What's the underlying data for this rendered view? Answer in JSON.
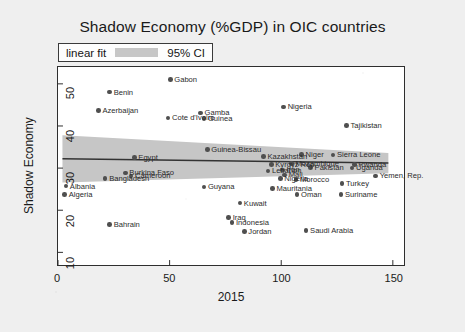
{
  "chart_data": {
    "type": "scatter",
    "title": "Shadow Economy (%GDP) in OIC countries",
    "xlabel": "2015",
    "ylabel": "Shadow Economy",
    "xlim": [
      0,
      155
    ],
    "ylim": [
      7,
      54
    ],
    "xticks": [
      "0",
      "50",
      "100",
      "150"
    ],
    "xtick_values": [
      0,
      50,
      100,
      150
    ],
    "yticks": [
      "10",
      "20",
      "30",
      "40",
      "50"
    ],
    "ytick_values": [
      10,
      20,
      30,
      40,
      50
    ],
    "grid": false,
    "legend_position": "above-plot-left",
    "legend": [
      {
        "label": "linear fit",
        "type": "line",
        "color": "#333333"
      },
      {
        "label": "95% CI",
        "type": "band",
        "color": "#c6c6c6"
      }
    ],
    "fit": {
      "name": "linear fit",
      "color": "#333333",
      "x_start": 2,
      "x_end": 148,
      "y_start": 32.2,
      "y_end": 31.2
    },
    "ci_band": {
      "name": "95% CI",
      "color": "#c6c6c6",
      "x_start": 2,
      "x_end": 148,
      "upper_start": 37.8,
      "upper_end": 33.6,
      "lower_start": 26.6,
      "lower_end": 28.8
    },
    "point_color": "#4f4f4f",
    "points": [
      {
        "label": "Gabon",
        "x": 50.0,
        "y": 51.0
      },
      {
        "label": "Benin",
        "x": 23.0,
        "y": 48.1
      },
      {
        "label": "Azerbaijan",
        "x": 18.0,
        "y": 43.8
      },
      {
        "label": "Cote d'Ivoire",
        "x": 49.0,
        "y": 42.0
      },
      {
        "label": "Gamba",
        "x": 63.5,
        "y": 43.2
      },
      {
        "label": "Guinea",
        "x": 65.0,
        "y": 41.9
      },
      {
        "label": "Nigeria",
        "x": 100.5,
        "y": 44.6
      },
      {
        "label": "Tajikistan",
        "x": 128.5,
        "y": 40.2
      },
      {
        "label": "Guinea-Bissau",
        "x": 66.5,
        "y": 34.6
      },
      {
        "label": "Egypt",
        "x": 34.0,
        "y": 32.8
      },
      {
        "label": "Kazakhstan",
        "x": 91.5,
        "y": 33.0
      },
      {
        "label": "Niger",
        "x": 108.5,
        "y": 33.4
      },
      {
        "label": "Sierra Leone",
        "x": 122.5,
        "y": 33.3
      },
      {
        "label": "Kyrgyz Rep.",
        "x": 95.0,
        "y": 31.1
      },
      {
        "label": "Mozambique",
        "x": 104.0,
        "y": 31.3
      },
      {
        "label": "Rwanda",
        "x": 132.0,
        "y": 31.1
      },
      {
        "label": "Uganda",
        "x": 131.0,
        "y": 30.3
      },
      {
        "label": "Pakistan",
        "x": 112.5,
        "y": 30.4
      },
      {
        "label": "Lebanon",
        "x": 93.5,
        "y": 29.6
      },
      {
        "label": "Iran",
        "x": 100.0,
        "y": 29.8
      },
      {
        "label": "Mali",
        "x": 101.0,
        "y": 28.6
      },
      {
        "label": "Nigeria2",
        "x": 99.0,
        "y": 27.8
      },
      {
        "label": "Morocco",
        "x": 106.0,
        "y": 27.5
      },
      {
        "label": "Yemen, Rep.",
        "x": 141.5,
        "y": 28.4
      },
      {
        "label": "Burkina Faso",
        "x": 30.0,
        "y": 29.1
      },
      {
        "label": "Cameroon",
        "x": 32.5,
        "y": 28.4
      },
      {
        "label": "Bangladesh",
        "x": 21.0,
        "y": 27.8
      },
      {
        "label": "Albania",
        "x": 3.5,
        "y": 26.0
      },
      {
        "label": "Algeria",
        "x": 3.0,
        "y": 24.1
      },
      {
        "label": "Mauritania",
        "x": 95.5,
        "y": 25.5
      },
      {
        "label": "Guyana",
        "x": 65.0,
        "y": 25.8
      },
      {
        "label": "Oman",
        "x": 106.5,
        "y": 24.0
      },
      {
        "label": "Suriname",
        "x": 126.0,
        "y": 24.1
      },
      {
        "label": "Turkey",
        "x": 126.5,
        "y": 26.6
      },
      {
        "label": "Kuwait",
        "x": 81.0,
        "y": 22.0
      },
      {
        "label": "Bahrain",
        "x": 23.0,
        "y": 17.0
      },
      {
        "label": "Iraq",
        "x": 76.0,
        "y": 18.6
      },
      {
        "label": "Indonesia",
        "x": 77.5,
        "y": 17.4
      },
      {
        "label": "Jordan",
        "x": 83.0,
        "y": 15.4
      },
      {
        "label": "Saudi Arabia",
        "x": 110.5,
        "y": 15.6
      }
    ],
    "visible_labels": [
      {
        "text": "Gabon",
        "x": 50.0,
        "y": 51.0,
        "anchor": "right"
      },
      {
        "text": "Benin",
        "x": 23.0,
        "y": 48.1,
        "anchor": "right"
      },
      {
        "text": "Azerbaijan",
        "x": 18.0,
        "y": 43.8,
        "anchor": "right"
      },
      {
        "text": "Cote d'Ivoire",
        "x": 49.0,
        "y": 42.0,
        "anchor": "right"
      },
      {
        "text": "Gamba",
        "x": 63.5,
        "y": 43.2,
        "anchor": "right"
      },
      {
        "text": "Guinea",
        "x": 65.0,
        "y": 41.9,
        "anchor": "right"
      },
      {
        "text": "Nigeria",
        "x": 100.5,
        "y": 44.6,
        "anchor": "right"
      },
      {
        "text": "Tajikistan",
        "x": 128.5,
        "y": 40.2,
        "anchor": "right"
      },
      {
        "text": "Guinea-Bissau",
        "x": 66.5,
        "y": 34.6,
        "anchor": "right"
      },
      {
        "text": "Egypt",
        "x": 34.0,
        "y": 32.8,
        "anchor": "right"
      },
      {
        "text": "Kazakhstan",
        "x": 91.5,
        "y": 33.0,
        "anchor": "right"
      },
      {
        "text": "Niger",
        "x": 108.5,
        "y": 33.4,
        "anchor": "right"
      },
      {
        "text": "Sierra Leone",
        "x": 122.5,
        "y": 33.3,
        "anchor": "right"
      },
      {
        "text": "Kyrgyz Rep.",
        "x": 95.0,
        "y": 31.1,
        "anchor": "right"
      },
      {
        "text": "Mozambique",
        "x": 104.0,
        "y": 31.3,
        "anchor": "right"
      },
      {
        "text": "Rwanda",
        "x": 132.0,
        "y": 31.1,
        "anchor": "right"
      },
      {
        "text": "Uganda",
        "x": 131.0,
        "y": 30.3,
        "anchor": "right"
      },
      {
        "text": "Pakistan",
        "x": 112.5,
        "y": 30.4,
        "anchor": "right"
      },
      {
        "text": "Lebanon",
        "x": 93.5,
        "y": 29.6,
        "anchor": "right"
      },
      {
        "text": "Iran",
        "x": 100.0,
        "y": 29.8,
        "anchor": "right"
      },
      {
        "text": "Mali",
        "x": 101.0,
        "y": 28.6,
        "anchor": "right"
      },
      {
        "text": "Nigeria",
        "x": 99.0,
        "y": 27.8,
        "anchor": "right"
      },
      {
        "text": "Morocco",
        "x": 106.0,
        "y": 27.5,
        "anchor": "right"
      },
      {
        "text": "Yemen, Rep.",
        "x": 141.5,
        "y": 28.4,
        "anchor": "right"
      },
      {
        "text": "Burkina Faso",
        "x": 30.0,
        "y": 29.1,
        "anchor": "right"
      },
      {
        "text": "Cameroon",
        "x": 32.5,
        "y": 28.4,
        "anchor": "right"
      },
      {
        "text": "Bangladesh",
        "x": 21.0,
        "y": 27.8,
        "anchor": "right"
      },
      {
        "text": "Albania",
        "x": 3.5,
        "y": 26.0,
        "anchor": "right"
      },
      {
        "text": "Algeria",
        "x": 3.0,
        "y": 24.1,
        "anchor": "right"
      },
      {
        "text": "Mauritania",
        "x": 95.5,
        "y": 25.5,
        "anchor": "right"
      },
      {
        "text": "Guyana",
        "x": 65.0,
        "y": 25.8,
        "anchor": "right"
      },
      {
        "text": "Oman",
        "x": 106.5,
        "y": 24.0,
        "anchor": "right"
      },
      {
        "text": "Suriname",
        "x": 126.0,
        "y": 24.1,
        "anchor": "right"
      },
      {
        "text": "Turkey",
        "x": 126.5,
        "y": 26.6,
        "anchor": "right"
      },
      {
        "text": "Kuwait",
        "x": 81.0,
        "y": 22.0,
        "anchor": "right"
      },
      {
        "text": "Bahrain",
        "x": 23.0,
        "y": 17.0,
        "anchor": "right"
      },
      {
        "text": "Iraq",
        "x": 76.0,
        "y": 18.6,
        "anchor": "right"
      },
      {
        "text": "Indonesia",
        "x": 77.5,
        "y": 17.4,
        "anchor": "right"
      },
      {
        "text": "Jordan",
        "x": 83.0,
        "y": 15.4,
        "anchor": "right"
      },
      {
        "text": "Saudi Arabia",
        "x": 110.5,
        "y": 15.6,
        "anchor": "right"
      }
    ]
  }
}
